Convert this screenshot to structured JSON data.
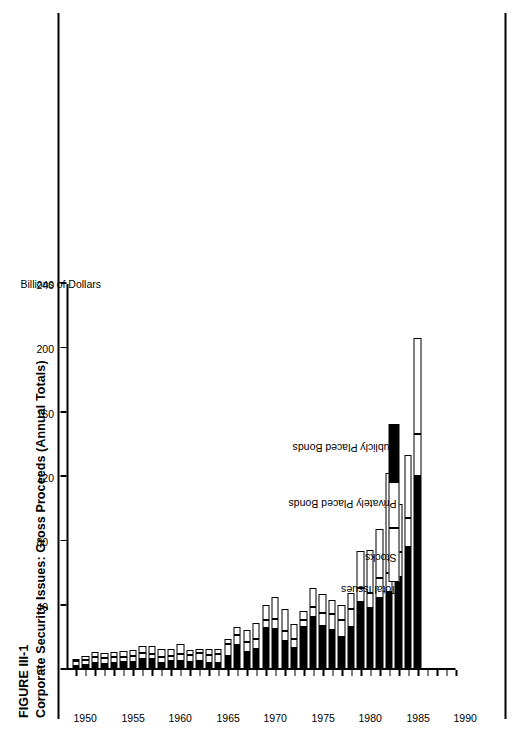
{
  "figure": {
    "label": "FIGURE III-1",
    "title": "Corporate Security Issues: Gross Proceeds (Annual Totals)"
  },
  "legend": {
    "items": [
      {
        "key": "total",
        "label": "Total Issues"
      },
      {
        "key": "stocks",
        "label": "Stocks"
      },
      {
        "key": "private",
        "label": "Privately Placed Bonds"
      },
      {
        "key": "public",
        "label": "Publicly Placed Bonds"
      }
    ],
    "colors": {
      "stocks": "#ffffff",
      "private": "#ffffff",
      "public": "#000000",
      "outline": "#000000"
    }
  },
  "chart_data": {
    "type": "bar",
    "orientation": "horizontal-stacked-rotated",
    "title": "Corporate Security Issues: Gross Proceeds (Annual Totals)",
    "xlabel": "",
    "ylabel": "Billions of Dollars",
    "value_axis_title": "Billions of Dollars",
    "value_ticks": [
      0,
      40,
      80,
      120,
      160,
      200,
      240
    ],
    "vlim": [
      0,
      240
    ],
    "year_ticks": [
      1950,
      1955,
      1960,
      1965,
      1970,
      1975,
      1980,
      1985,
      1990
    ],
    "ylim": [
      1949,
      1990
    ],
    "grid": false,
    "legend_position": "inside-left",
    "categories": [
      1950,
      1951,
      1952,
      1953,
      1954,
      1955,
      1956,
      1957,
      1958,
      1959,
      1960,
      1961,
      1962,
      1963,
      1964,
      1965,
      1966,
      1967,
      1968,
      1969,
      1970,
      1971,
      1972,
      1973,
      1974,
      1975,
      1976,
      1977,
      1978,
      1979,
      1980,
      1981,
      1982,
      1983,
      1984,
      1985,
      1986
    ],
    "series": [
      {
        "name": "Publicly Placed Bonds",
        "values": [
          2.1,
          2.4,
          3.6,
          3.3,
          4.0,
          4.1,
          4.2,
          6.1,
          6.3,
          3.6,
          4.8,
          4.7,
          4.4,
          4.7,
          3.6,
          3.7,
          8.0,
          14.9,
          10.7,
          12.7,
          25.4,
          25.0,
          17.4,
          13.0,
          25.9,
          32.6,
          26.5,
          24.1,
          20.0,
          26.0,
          41.6,
          38.0,
          44.3,
          47.7,
          57.5,
          76.0,
          120.0
        ]
      },
      {
        "name": "Privately Placed Bonds",
        "values": [
          2.6,
          3.2,
          3.9,
          3.8,
          3.5,
          3.3,
          3.8,
          3.8,
          3.3,
          3.6,
          3.3,
          4.7,
          4.5,
          5.0,
          5.3,
          5.6,
          7.5,
          6.5,
          6.2,
          6.0,
          5.0,
          6.0,
          6.1,
          5.5,
          4.3,
          6.2,
          8.2,
          9.9,
          10.5,
          11.0,
          8.7,
          9.0,
          12.0,
          12.0,
          15.0,
          18.0,
          26.0
        ]
      },
      {
        "name": "Stocks",
        "values": [
          1.7,
          2.6,
          2.9,
          2.8,
          3.3,
          3.7,
          4.0,
          4.4,
          4.4,
          5.0,
          4.1,
          6.3,
          3.2,
          2.8,
          3.6,
          3.2,
          3.4,
          4.6,
          7.1,
          9.9,
          9.1,
          13.8,
          13.9,
          9.3,
          6.0,
          11.6,
          11.8,
          9.1,
          9.6,
          10.0,
          23.0,
          27.0,
          31.0,
          62.0,
          30.0,
          39.0,
          60.0
        ]
      }
    ]
  }
}
